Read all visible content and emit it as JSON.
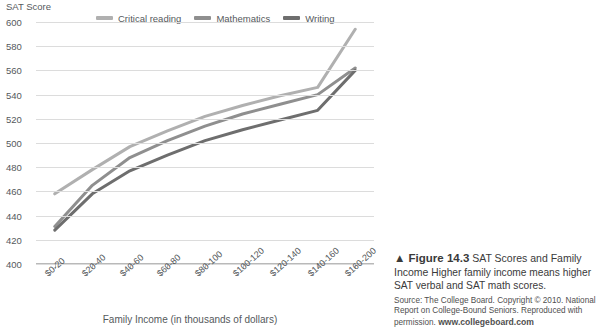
{
  "chart_data": {
    "type": "line",
    "title": "",
    "xlabel": "Family Income (in thousands of dollars)",
    "ylabel": "SAT Score",
    "ylim": [
      400,
      600
    ],
    "ytick_step": 20,
    "yticks": [
      600,
      580,
      560,
      540,
      520,
      500,
      480,
      460,
      440,
      420,
      400
    ],
    "grid": true,
    "legend_position": "top",
    "categories": [
      "$0-20",
      "$20-40",
      "$40-60",
      "$60-80",
      "$80-100",
      "$100-120",
      "$120-140",
      "$140-160",
      "$160-200"
    ],
    "series": [
      {
        "name": "Critical reading",
        "color": "#b0b0b0",
        "values": [
          458,
          478,
          497,
          510,
          522,
          531,
          539,
          546,
          594
        ]
      },
      {
        "name": "Mathematics",
        "color": "#8f8f8f",
        "values": [
          431,
          465,
          488,
          502,
          514,
          524,
          532,
          540,
          562
        ]
      },
      {
        "name": "Writing",
        "color": "#6e6e6e",
        "values": [
          428,
          458,
          477,
          490,
          502,
          511,
          519,
          527,
          560
        ]
      }
    ]
  },
  "legend": {
    "items": [
      {
        "label": "Critical reading",
        "color": "#b0b0b0"
      },
      {
        "label": "Mathematics",
        "color": "#8f8f8f"
      },
      {
        "label": "Writing",
        "color": "#6e6e6e"
      }
    ]
  },
  "caption": {
    "marker": "▲",
    "figure_label": "Figure 14.3",
    "title": "SAT Scores and Family Income",
    "body": "Higher family income means higher SAT verbal and SAT math scores.",
    "source_text": "Source: The College Board. Copyright © 2010. National Report on College-Bound Seniors. Reproduced with permission.",
    "source_site": "www.collegeboard.com"
  }
}
